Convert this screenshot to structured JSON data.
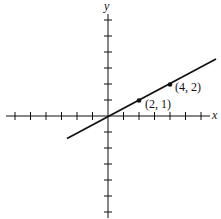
{
  "figure": {
    "axis_x_label": "x",
    "axis_y_label": "y",
    "points": [
      {
        "label": "(2, 1)",
        "x": 2,
        "y": 1
      },
      {
        "label": "(4, 2)",
        "x": 4,
        "y": 2
      }
    ],
    "line": {
      "equation": "y = x/2",
      "slope": 0.5,
      "intercept": 0
    },
    "ticks": {
      "x": [
        -6,
        -5,
        -4,
        -3,
        -2,
        -1,
        1,
        2,
        3,
        4,
        5,
        6
      ],
      "y": [
        -6,
        -5,
        -4,
        -3,
        -2,
        -1,
        1,
        2,
        3,
        4,
        5,
        6
      ]
    },
    "colors": {
      "ink": "#111111",
      "background": "#ffffff"
    }
  }
}
